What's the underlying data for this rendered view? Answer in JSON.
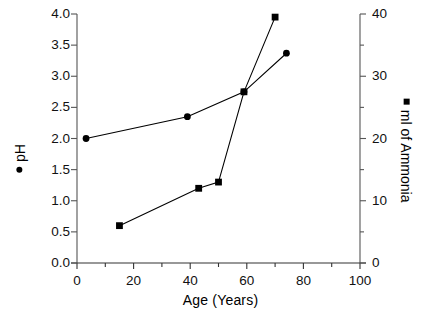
{
  "chart_data": {
    "type": "line",
    "title": "",
    "xlabel": "Age  (Years)",
    "xlim": [
      0,
      100
    ],
    "xticks": [
      0,
      20,
      40,
      60,
      80,
      100
    ],
    "xticklabels": [
      "0",
      "20",
      "40",
      "60",
      "80",
      "100"
    ],
    "xminorticks": [
      10,
      30,
      50,
      70,
      90
    ],
    "grid": false,
    "legend_position": "axis-labels",
    "axes": [
      {
        "id": "left",
        "label": "pH",
        "marker": "circle",
        "ylim": [
          0.0,
          4.0
        ],
        "yticks": [
          0.0,
          0.5,
          1.0,
          1.5,
          2.0,
          2.5,
          3.0,
          3.5,
          4.0
        ],
        "yticklabels": [
          "0.0",
          "0.5",
          "1.0",
          "1.5",
          "2.0",
          "2.5",
          "3.0",
          "3.5",
          "4.0"
        ]
      },
      {
        "id": "right",
        "label": "ml of Ammonia",
        "marker": "square",
        "ylim": [
          0,
          40
        ],
        "yticks": [
          0,
          10,
          20,
          30,
          40
        ],
        "yticklabels": [
          "0",
          "10",
          "20",
          "30",
          "40"
        ],
        "yminorticks": [
          5,
          15,
          25,
          35
        ]
      }
    ],
    "series": [
      {
        "name": "pH",
        "axis": "left",
        "marker": "circle",
        "color": "#000000",
        "x": [
          3.2,
          39.0,
          59.0,
          74.0
        ],
        "y": [
          2.0,
          2.35,
          2.75,
          3.37
        ]
      },
      {
        "name": "ml of Ammonia",
        "axis": "right",
        "marker": "square",
        "color": "#000000",
        "x": [
          15.0,
          43.0,
          50.0,
          59.0,
          70.0
        ],
        "y": [
          6.0,
          12.0,
          13.0,
          27.5,
          39.5
        ]
      }
    ]
  },
  "labels": {
    "xaxis_title": "Age  (Years)",
    "left_legend": "pH",
    "right_legend": "ml of Ammonia"
  }
}
